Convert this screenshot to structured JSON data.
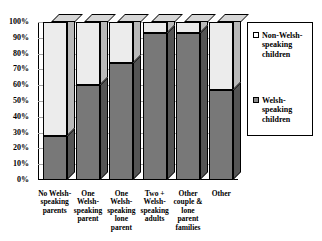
{
  "chart_data": {
    "type": "bar",
    "subtype": "stacked-column-100-percent-3d",
    "title": "",
    "xlabel": "",
    "ylabel": "",
    "ylim": [
      0,
      100
    ],
    "ytick_labels": [
      "0%",
      "10%",
      "20%",
      "30%",
      "40%",
      "50%",
      "60%",
      "70%",
      "80%",
      "90%",
      "100%"
    ],
    "ytick_values": [
      0,
      10,
      20,
      30,
      40,
      50,
      60,
      70,
      80,
      90,
      100
    ],
    "grid": true,
    "legend_position": "right",
    "categories": [
      "No Welsh-speaking parents",
      "One Welsh-speaking parent",
      "One Welsh-speaking lone parent",
      "Two + Welsh-speaking adults",
      "Other couple & lone parent families",
      "Other"
    ],
    "series": [
      {
        "name": "Welsh-speaking children",
        "color": "#787878",
        "values": [
          28,
          60,
          74,
          93,
          93,
          57
        ]
      },
      {
        "name": "Non-Welsh-speaking children",
        "color": "#ececec",
        "values": [
          72,
          40,
          26,
          7,
          7,
          43
        ]
      }
    ]
  },
  "axis": {
    "y_ticks": [
      {
        "label": "100%",
        "value": 100
      },
      {
        "label": "90%",
        "value": 90
      },
      {
        "label": "80%",
        "value": 80
      },
      {
        "label": "70%",
        "value": 70
      },
      {
        "label": "60%",
        "value": 60
      },
      {
        "label": "50%",
        "value": 50
      },
      {
        "label": "40%",
        "value": 40
      },
      {
        "label": "30%",
        "value": 30
      },
      {
        "label": "20%",
        "value": 20
      },
      {
        "label": "10%",
        "value": 10
      },
      {
        "label": "0%",
        "value": 0
      }
    ],
    "x_categories": [
      {
        "lines": [
          "No Welsh-",
          "speaking",
          "parents"
        ]
      },
      {
        "lines": [
          "One",
          "Welsh-",
          "speaking",
          "parent"
        ]
      },
      {
        "lines": [
          "One",
          "Welsh-",
          "speaking",
          "lone",
          "parent"
        ]
      },
      {
        "lines": [
          "Two +",
          "Welsh-",
          "speaking",
          "adults"
        ]
      },
      {
        "lines": [
          "Other",
          "couple &",
          "lone",
          "parent",
          "families"
        ]
      },
      {
        "lines": [
          "Other"
        ]
      }
    ]
  },
  "legend": {
    "items": [
      {
        "label": "Non-Welsh-speaking children",
        "swatch": "light"
      },
      {
        "label": "Welsh-speaking children",
        "swatch": "dark"
      }
    ]
  }
}
